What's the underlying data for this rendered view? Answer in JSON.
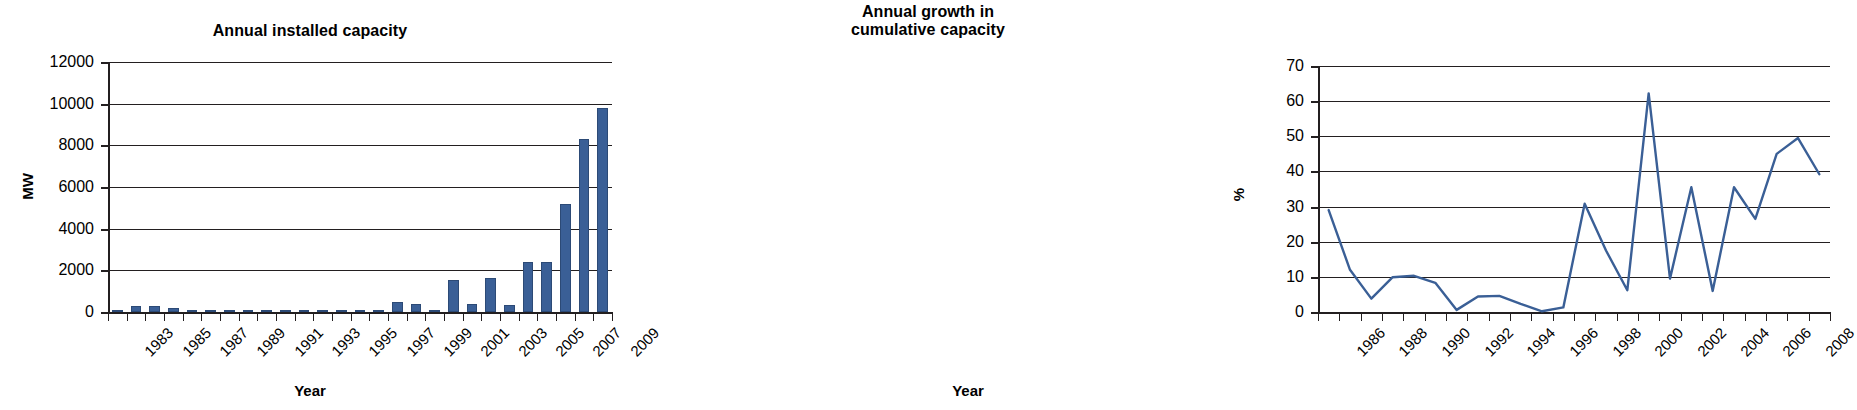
{
  "colors": {
    "series": "#3a5f96",
    "axis": "#231f20",
    "grid": "#231f20",
    "background": "#ffffff"
  },
  "panels": [
    {
      "id": "annual-installed-capacity",
      "title": "Annual installed capacity",
      "ylabel": "MW",
      "xlabel": "Year"
    },
    {
      "id": "annual-growth-cumulative-capacity",
      "title_line1": "Annual growth in",
      "title_line2": "cumulative capacity",
      "ylabel": "%",
      "xlabel": "Year"
    }
  ],
  "chart_data": [
    {
      "type": "bar",
      "title": "Annual installed capacity",
      "xlabel": "Year",
      "ylabel": "MW",
      "ylim": [
        0,
        12000
      ],
      "yticks": [
        0,
        2000,
        4000,
        6000,
        8000,
        10000,
        12000
      ],
      "ytick_labels": [
        "0",
        "2000",
        "4000",
        "6000",
        "8000",
        "10000",
        "12000"
      ],
      "grid": true,
      "legend": "none",
      "label_interval": 2,
      "xtick_labels": [
        "1983",
        "1985",
        "1987",
        "1989",
        "1991",
        "1993",
        "1995",
        "1997",
        "1999",
        "2001",
        "2003",
        "2005",
        "2007",
        "2009"
      ],
      "categories": [
        1983,
        1984,
        1985,
        1986,
        1987,
        1988,
        1989,
        1990,
        1991,
        1992,
        1993,
        1994,
        1995,
        1996,
        1997,
        1998,
        1999,
        2000,
        2001,
        2002,
        2003,
        2004,
        2005,
        2006,
        2007,
        2008,
        2009
      ],
      "values": [
        90,
        310,
        310,
        190,
        20,
        15,
        15,
        20,
        30,
        20,
        10,
        5,
        5,
        10,
        50,
        480,
        370,
        30,
        1540,
        370,
        1620,
        330,
        2380,
        2380,
        5170,
        8290,
        9790
      ]
    },
    {
      "type": "line",
      "title": "Annual growth in cumulative capacity",
      "xlabel": "Year",
      "ylabel": "%",
      "ylim": [
        0,
        70
      ],
      "yticks": [
        0,
        10,
        20,
        30,
        40,
        50,
        60,
        70
      ],
      "ytick_labels": [
        "0",
        "10",
        "20",
        "30",
        "40",
        "50",
        "60",
        "70"
      ],
      "grid": true,
      "legend": "none",
      "label_interval": 2,
      "xtick_labels": [
        "1986",
        "1988",
        "1990",
        "1992",
        "1994",
        "1996",
        "1998",
        "2000",
        "2002",
        "2004",
        "2006",
        "2008"
      ],
      "x": [
        1986,
        1987,
        1988,
        1989,
        1990,
        1991,
        1992,
        1993,
        1994,
        1995,
        1996,
        1997,
        1998,
        1999,
        2000,
        2001,
        2002,
        2003,
        2004,
        2005,
        2006,
        2007,
        2008,
        2009
      ],
      "values": [
        29.0,
        12.0,
        3.8,
        9.9,
        10.3,
        8.3,
        0.6,
        4.4,
        4.6,
        2.3,
        0.2,
        1.3,
        30.8,
        17.5,
        6.2,
        62.2,
        9.5,
        35.5,
        6.0,
        35.5,
        26.5,
        45.0,
        49.5,
        39.2
      ]
    }
  ]
}
